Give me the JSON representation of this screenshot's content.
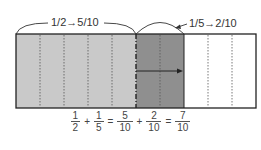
{
  "diagram": {
    "total_parts": 10,
    "colors": {
      "light_fill": "#c9c9c9",
      "dark_fill": "#8f8f8f",
      "empty_fill": "#ffffff",
      "border": "#222222",
      "divider": "#555555"
    },
    "segments": [
      {
        "name": "first-addend",
        "parts": 5,
        "fill": "light"
      },
      {
        "name": "second-addend",
        "parts": 2,
        "fill": "dark"
      },
      {
        "name": "remaining",
        "parts": 3,
        "fill": "empty"
      }
    ],
    "labels": {
      "first_conversion": "1/2→5/10",
      "second_conversion": "1/5→2/10"
    }
  },
  "formula": {
    "terms": [
      {
        "num": "1",
        "den": "2"
      },
      {
        "op": "+"
      },
      {
        "num": "1",
        "den": "5"
      },
      {
        "op": "="
      },
      {
        "num": "5",
        "den": "10"
      },
      {
        "op": "+"
      },
      {
        "num": "2",
        "den": "10"
      },
      {
        "op": "="
      },
      {
        "num": "7",
        "den": "10"
      }
    ],
    "t0_num": "1",
    "t0_den": "2",
    "op1": "+",
    "t1_num": "1",
    "t1_den": "5",
    "op2": "=",
    "t2_num": "5",
    "t2_den": "10",
    "op3": "+",
    "t3_num": "2",
    "t3_den": "10",
    "op4": "=",
    "t4_num": "7",
    "t4_den": "10"
  }
}
